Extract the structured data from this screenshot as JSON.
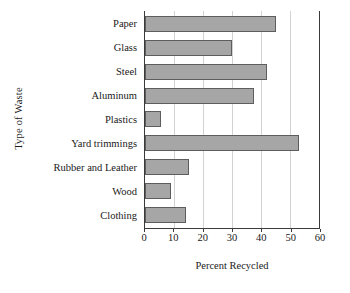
{
  "chart_data": {
    "type": "bar",
    "orientation": "horizontal",
    "title": "",
    "xlabel": "Percent Recycled",
    "ylabel": "Type of Waste",
    "categories": [
      "Paper",
      "Glass",
      "Steel",
      "Aluminum",
      "Plastics",
      "Yard trimmings",
      "Rubber and Leather",
      "Wood",
      "Clothing"
    ],
    "values": [
      45,
      30,
      42,
      37.5,
      5.5,
      53,
      15,
      9,
      14
    ],
    "xlim": [
      0,
      60
    ],
    "xticks": [
      0,
      10,
      20,
      30,
      40,
      50,
      60
    ],
    "xticklabels": [
      "0",
      "10",
      "20",
      "30",
      "40",
      "50",
      "60"
    ],
    "grid": "vertical",
    "legend": "none",
    "bar_color": "#a6a6a6",
    "bar_edge_color": "#5d5d5d",
    "axis_color": "#3a3a3a",
    "gridline_color": "#d2d2d2"
  },
  "figure": {
    "title_remnant": "",
    "xlabel": "Percent Recycled",
    "ylabel": "Type of Waste"
  }
}
